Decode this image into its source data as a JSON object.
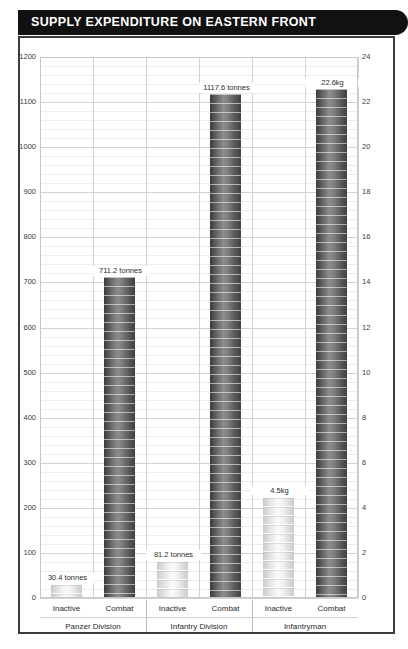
{
  "header": {
    "title": "SUPPLY EXPENDITURE ON EASTERN FRONT"
  },
  "chart_data": {
    "type": "bar",
    "title": "SUPPLY EXPENDITURE ON EASTERN FRONT",
    "xlabel": "",
    "ylabel": "",
    "grid": true,
    "legend": false,
    "y_left": {
      "label": "",
      "unit": "tonnes",
      "min": 0,
      "max": 1200,
      "tick_step": 100,
      "minor_step": 20,
      "ticks": [
        0,
        100,
        200,
        300,
        400,
        500,
        600,
        700,
        800,
        900,
        1000,
        1100,
        1200
      ],
      "tick_labels": [
        "0",
        "100",
        "200",
        "300",
        "400",
        "500",
        "600",
        "700",
        "800",
        "900",
        "1000",
        "1100",
        "1200"
      ]
    },
    "y_right": {
      "label": "",
      "unit": "kg",
      "min": 0,
      "max": 24,
      "tick_step": 2,
      "ticks": [
        0,
        2,
        4,
        6,
        8,
        10,
        12,
        14,
        16,
        18,
        20,
        22,
        24
      ],
      "tick_labels": [
        "0",
        "2",
        "4",
        "6",
        "8",
        "10",
        "12",
        "14",
        "16",
        "18",
        "20",
        "22",
        "24"
      ]
    },
    "groups": [
      {
        "name": "Panzer Division",
        "axis": "left",
        "bars": [
          {
            "category": "Inactive",
            "value": 30.4,
            "label": "30.4 tonnes",
            "style": "light"
          },
          {
            "category": "Combat",
            "value": 711.2,
            "label": "711.2 tonnes",
            "style": "dark"
          }
        ]
      },
      {
        "name": "Infantry Division",
        "axis": "left",
        "bars": [
          {
            "category": "Inactive",
            "value": 81.2,
            "label": "81.2 tonnes",
            "style": "light"
          },
          {
            "category": "Combat",
            "value": 1117.6,
            "label": "1117.6 tonnes",
            "style": "dark"
          }
        ]
      },
      {
        "name": "Infantryman",
        "axis": "right",
        "bars": [
          {
            "category": "Inactive",
            "value": 4.5,
            "label": "4.5kg",
            "style": "light"
          },
          {
            "category": "Combat",
            "value": 22.6,
            "label": "22.6kg",
            "style": "dark"
          }
        ]
      }
    ]
  },
  "colors": {
    "title_bar": "#111111",
    "title_text": "#ffffff",
    "frame": "#3c3c3c",
    "grid_major": "#d3d3d3",
    "grid_minor": "#ededed",
    "bar_dark": "#5a5a5a",
    "bar_light": "#e0e0e0",
    "text": "#2b2b2b"
  }
}
